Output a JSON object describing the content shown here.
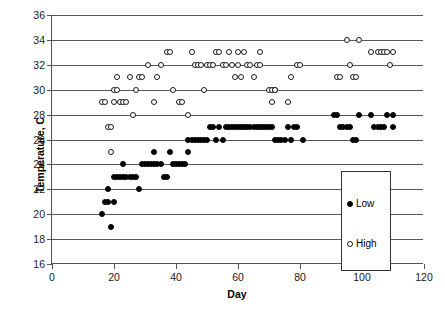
{
  "chart_data": {
    "type": "scatter",
    "title": "",
    "xlabel": "Day",
    "ylabel": "Temperature, C",
    "xlim": [
      0,
      120
    ],
    "ylim": [
      16,
      36
    ],
    "xticks": [
      0,
      20,
      40,
      60,
      80,
      100,
      120
    ],
    "yticks": [
      16,
      18,
      20,
      22,
      24,
      26,
      28,
      30,
      32,
      34,
      36
    ],
    "grid": "horizontal",
    "legend_position": "center-right-inside",
    "colors": {
      "low_marker": "#000000",
      "high_marker": "#ffffff",
      "marker_edge": "#1a1a1a",
      "gridline": "#595959",
      "axis": "#555555",
      "text": "#000000"
    },
    "series": [
      {
        "name": "Low",
        "marker": "filled-circle",
        "points": [
          [
            16,
            20
          ],
          [
            17,
            21
          ],
          [
            18,
            21
          ],
          [
            18,
            22
          ],
          [
            19,
            19
          ],
          [
            20,
            21
          ],
          [
            20,
            23
          ],
          [
            21,
            23
          ],
          [
            22,
            23
          ],
          [
            23,
            23
          ],
          [
            23,
            24
          ],
          [
            24,
            23
          ],
          [
            25,
            23
          ],
          [
            26,
            23
          ],
          [
            27,
            23
          ],
          [
            28,
            22
          ],
          [
            29,
            24
          ],
          [
            30,
            24
          ],
          [
            31,
            24
          ],
          [
            32,
            24
          ],
          [
            33,
            25
          ],
          [
            33,
            24
          ],
          [
            34,
            24
          ],
          [
            35,
            24
          ],
          [
            36,
            23
          ],
          [
            37,
            23
          ],
          [
            38,
            25
          ],
          [
            39,
            24
          ],
          [
            40,
            24
          ],
          [
            41,
            24
          ],
          [
            42,
            24
          ],
          [
            43,
            24
          ],
          [
            44,
            25
          ],
          [
            44,
            26
          ],
          [
            45,
            26
          ],
          [
            46,
            26
          ],
          [
            47,
            26
          ],
          [
            48,
            26
          ],
          [
            49,
            26
          ],
          [
            50,
            26
          ],
          [
            51,
            27
          ],
          [
            52,
            27
          ],
          [
            53,
            26
          ],
          [
            54,
            27
          ],
          [
            55,
            26
          ],
          [
            56,
            27
          ],
          [
            57,
            27
          ],
          [
            58,
            27
          ],
          [
            59,
            27
          ],
          [
            60,
            27
          ],
          [
            61,
            27
          ],
          [
            62,
            27
          ],
          [
            63,
            27
          ],
          [
            64,
            27
          ],
          [
            65,
            27
          ],
          [
            66,
            27
          ],
          [
            67,
            27
          ],
          [
            68,
            27
          ],
          [
            69,
            27
          ],
          [
            70,
            27
          ],
          [
            71,
            27
          ],
          [
            72,
            26
          ],
          [
            73,
            26
          ],
          [
            74,
            26
          ],
          [
            75,
            26
          ],
          [
            76,
            27
          ],
          [
            77,
            26
          ],
          [
            78,
            27
          ],
          [
            79,
            27
          ],
          [
            81,
            26
          ],
          [
            91,
            28
          ],
          [
            92,
            28
          ],
          [
            93,
            27
          ],
          [
            94,
            27
          ],
          [
            95,
            27
          ],
          [
            96,
            27
          ],
          [
            97,
            26
          ],
          [
            98,
            26
          ],
          [
            99,
            28
          ],
          [
            103,
            28
          ],
          [
            104,
            27
          ],
          [
            105,
            27
          ],
          [
            106,
            27
          ],
          [
            107,
            27
          ],
          [
            108,
            28
          ],
          [
            110,
            28
          ],
          [
            110,
            27
          ]
        ]
      },
      {
        "name": "High",
        "marker": "open-circle",
        "points": [
          [
            16,
            29
          ],
          [
            17,
            29
          ],
          [
            18,
            27
          ],
          [
            19,
            27
          ],
          [
            19,
            25
          ],
          [
            20,
            29
          ],
          [
            20,
            30
          ],
          [
            21,
            30
          ],
          [
            21,
            31
          ],
          [
            22,
            29
          ],
          [
            23,
            29
          ],
          [
            24,
            29
          ],
          [
            25,
            31
          ],
          [
            26,
            28
          ],
          [
            27,
            30
          ],
          [
            28,
            31
          ],
          [
            29,
            31
          ],
          [
            31,
            32
          ],
          [
            33,
            29
          ],
          [
            34,
            31
          ],
          [
            35,
            32
          ],
          [
            37,
            33
          ],
          [
            38,
            33
          ],
          [
            39,
            30
          ],
          [
            41,
            29
          ],
          [
            42,
            29
          ],
          [
            44,
            28
          ],
          [
            45,
            33
          ],
          [
            46,
            32
          ],
          [
            47,
            32
          ],
          [
            48,
            32
          ],
          [
            49,
            30
          ],
          [
            50,
            32
          ],
          [
            51,
            32
          ],
          [
            52,
            32
          ],
          [
            53,
            33
          ],
          [
            54,
            33
          ],
          [
            55,
            32
          ],
          [
            56,
            32
          ],
          [
            57,
            33
          ],
          [
            58,
            32
          ],
          [
            59,
            31
          ],
          [
            60,
            33
          ],
          [
            60,
            32
          ],
          [
            61,
            31
          ],
          [
            62,
            33
          ],
          [
            63,
            32
          ],
          [
            64,
            32
          ],
          [
            65,
            31
          ],
          [
            66,
            32
          ],
          [
            67,
            33
          ],
          [
            67,
            32
          ],
          [
            70,
            30
          ],
          [
            71,
            30
          ],
          [
            71,
            29
          ],
          [
            72,
            30
          ],
          [
            72,
            30
          ],
          [
            76,
            29
          ],
          [
            77,
            31
          ],
          [
            79,
            32
          ],
          [
            80,
            32
          ],
          [
            92,
            31
          ],
          [
            93,
            31
          ],
          [
            95,
            34
          ],
          [
            96,
            32
          ],
          [
            97,
            31
          ],
          [
            98,
            31
          ],
          [
            99,
            34
          ],
          [
            103,
            33
          ],
          [
            105,
            33
          ],
          [
            106,
            33
          ],
          [
            107,
            33
          ],
          [
            108,
            33
          ],
          [
            109,
            32
          ],
          [
            110,
            33
          ]
        ]
      }
    ]
  },
  "legend": {
    "items": [
      {
        "label": "Low",
        "marker": "filled-circle"
      },
      {
        "label": "High",
        "marker": "open-circle"
      }
    ]
  },
  "axes": {
    "x_title": "Day",
    "y_title": "Temperature, C"
  }
}
